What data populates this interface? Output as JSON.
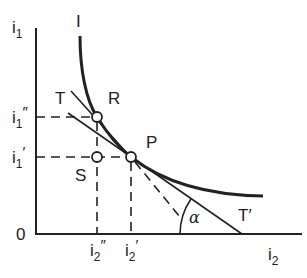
{
  "diagram": {
    "type": "indifference-curve-diagram",
    "colors": {
      "ink": "#222222",
      "background": "#ffffff"
    },
    "axes": {
      "origin_label": "0",
      "y_axis": {
        "label_base": "i",
        "label_sub": "1"
      },
      "x_axis": {
        "label_base": "i",
        "label_sub": "2"
      }
    },
    "ticks": {
      "y_upper": {
        "base": "i",
        "sub": "1",
        "prime": "″"
      },
      "y_lower": {
        "base": "i",
        "sub": "1",
        "prime": "′"
      },
      "x_left": {
        "base": "i",
        "sub": "2",
        "prime": "″"
      },
      "x_right": {
        "base": "i",
        "sub": "2",
        "prime": "′"
      }
    },
    "curve_label": "I",
    "points": {
      "R": "R",
      "P": "P",
      "S": "S"
    },
    "lines": {
      "tangent_start": "T",
      "tangent_end": "T′"
    },
    "angle_label": "α"
  }
}
